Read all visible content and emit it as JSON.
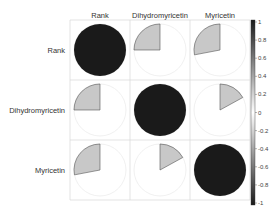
{
  "chart_data": {
    "type": "heatmap",
    "method": "pie",
    "title": "",
    "variables": [
      "Rank",
      "Dihydromyricetin",
      "Myricetin"
    ],
    "matrix": [
      [
        1.0,
        -0.25,
        -0.28
      ],
      [
        -0.25,
        1.0,
        0.17
      ],
      [
        -0.28,
        0.17,
        1.0
      ]
    ],
    "colorbar": {
      "range": [
        -1,
        1
      ],
      "ticks": [
        "1",
        "0.8",
        "0.6",
        "0.4",
        "0.2",
        "0",
        "-0.2",
        "-0.4",
        "-0.6",
        "-0.8",
        "-1"
      ],
      "colors": {
        "high": "#1a1a1a",
        "mid": "#ffffff",
        "low": "#1a1a1a"
      }
    },
    "grid": true,
    "legend_position": "right"
  }
}
